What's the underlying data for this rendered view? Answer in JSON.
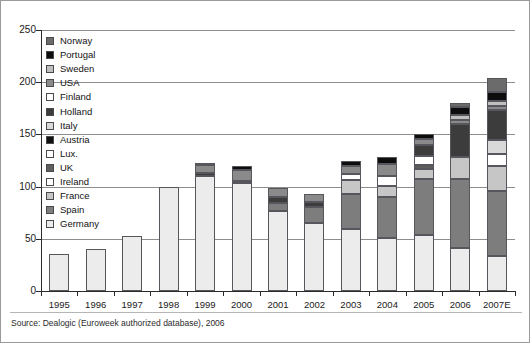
{
  "chart_data": {
    "type": "bar",
    "stacked": true,
    "title": "",
    "subtitle": "",
    "xlabel": "",
    "ylabel": "",
    "ylim": [
      0,
      250
    ],
    "yticks": [
      0,
      50,
      100,
      150,
      200,
      250
    ],
    "ytick_labels": [
      "0",
      "50",
      "100",
      "150",
      "200",
      "250"
    ],
    "grid": "horizontal",
    "legend_position": "top-left-inside",
    "categories": [
      "1995",
      "1996",
      "1997",
      "1998",
      "1999",
      "2000",
      "2001",
      "2002",
      "2003",
      "2004",
      "2005",
      "2006",
      "2007E"
    ],
    "series": [
      {
        "name": "Germany",
        "color": "#ececec",
        "values": [
          35,
          40,
          53,
          100,
          110,
          103,
          77,
          65,
          59,
          51,
          54,
          41,
          34
        ]
      },
      {
        "name": "Spain",
        "color": "#7d7d7d",
        "values": [
          0,
          0,
          0,
          0,
          0,
          0,
          7,
          15,
          34,
          39,
          53,
          66,
          62
        ]
      },
      {
        "name": "France",
        "color": "#c6c6c6",
        "values": [
          0,
          0,
          0,
          0,
          0,
          0,
          0,
          0,
          13,
          11,
          10,
          21,
          24
        ]
      },
      {
        "name": "Ireland",
        "color": "#ffffff",
        "values": [
          0,
          0,
          0,
          0,
          0,
          0,
          0,
          0,
          6,
          9,
          0,
          0,
          0
        ]
      },
      {
        "name": "UK",
        "color": "#5f5f5f",
        "values": [
          0,
          0,
          0,
          0,
          0,
          0,
          0,
          0,
          0,
          0,
          4,
          0,
          0
        ]
      },
      {
        "name": "Lux.",
        "color": "#ffffff",
        "values": [
          0,
          0,
          0,
          0,
          0,
          0,
          0,
          0,
          0,
          0,
          8,
          0,
          11
        ]
      },
      {
        "name": "Austria",
        "color": "#111111",
        "values": [
          0,
          0,
          0,
          0,
          0,
          0,
          0,
          0,
          0,
          0,
          0,
          0,
          0
        ]
      },
      {
        "name": "Italy",
        "color": "#d9d9d9",
        "values": [
          0,
          0,
          0,
          0,
          0,
          0,
          0,
          0,
          0,
          0,
          0,
          0,
          14
        ]
      },
      {
        "name": "Holland",
        "color": "#3c3c3c",
        "values": [
          0,
          0,
          0,
          0,
          3,
          2,
          6,
          5,
          0,
          0,
          11,
          32,
          28
        ]
      },
      {
        "name": "Finland",
        "color": "#ffffff",
        "values": [
          0,
          0,
          0,
          0,
          0,
          0,
          0,
          0,
          0,
          0,
          0,
          0,
          0
        ]
      },
      {
        "name": "USA",
        "color": "#8a8a8a",
        "values": [
          0,
          0,
          0,
          0,
          8,
          11,
          9,
          8,
          8,
          12,
          6,
          4,
          4
        ]
      },
      {
        "name": "Sweden",
        "color": "#bfbfbf",
        "values": [
          0,
          0,
          0,
          0,
          0,
          0,
          0,
          0,
          0,
          0,
          0,
          5,
          5
        ]
      },
      {
        "name": "Portugal",
        "color": "#0d0d0d",
        "values": [
          0,
          0,
          0,
          0,
          1,
          4,
          0,
          0,
          5,
          6,
          4,
          7,
          9
        ]
      },
      {
        "name": "Norway",
        "color": "#6b6b6b",
        "values": [
          0,
          0,
          0,
          0,
          0,
          0,
          0,
          0,
          0,
          0,
          0,
          4,
          13
        ]
      }
    ],
    "totals": [
      35,
      40,
      53,
      100,
      122,
      120,
      99,
      93,
      125,
      128,
      150,
      180,
      204
    ],
    "source_note": "Source: Dealogic (Euroweek authorized database), 2006"
  },
  "legend": {
    "items": [
      {
        "label": "Norway",
        "color": "#6b6b6b"
      },
      {
        "label": "Portugal",
        "color": "#0d0d0d"
      },
      {
        "label": "Sweden",
        "color": "#bfbfbf"
      },
      {
        "label": "USA",
        "color": "#8a8a8a"
      },
      {
        "label": "Finland",
        "color": "#ffffff"
      },
      {
        "label": "Holland",
        "color": "#3c3c3c"
      },
      {
        "label": "Italy",
        "color": "#d9d9d9"
      },
      {
        "label": "Austria",
        "color": "#111111"
      },
      {
        "label": "Lux.",
        "color": "#ffffff"
      },
      {
        "label": "UK",
        "color": "#5f5f5f"
      },
      {
        "label": "Ireland",
        "color": "#ffffff"
      },
      {
        "label": "France",
        "color": "#c6c6c6"
      },
      {
        "label": "Spain",
        "color": "#7d7d7d"
      },
      {
        "label": "Germany",
        "color": "#ececec"
      }
    ]
  },
  "footer": {
    "source": "Source: Dealogic (Euroweek authorized database), 2006"
  }
}
